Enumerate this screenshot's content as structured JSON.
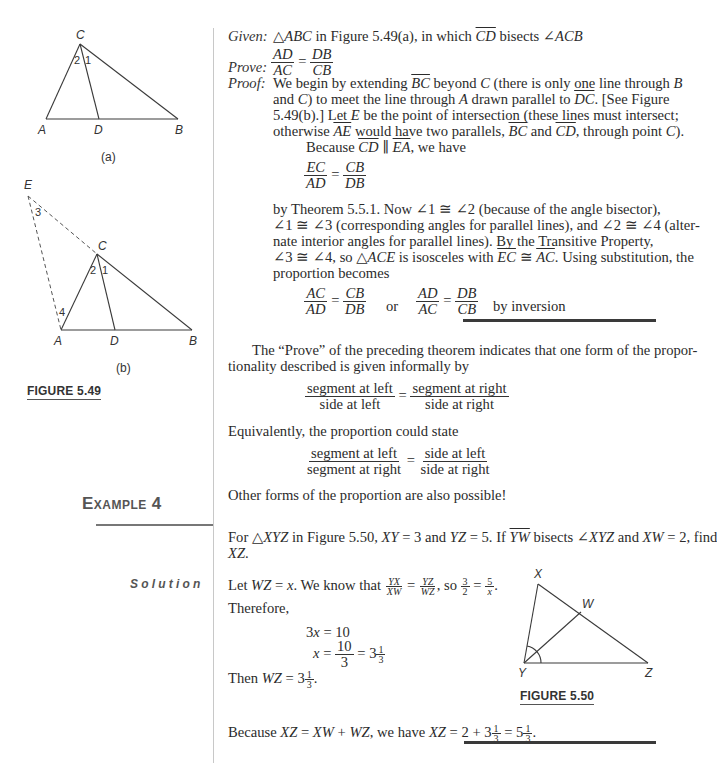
{
  "figure_5_49": {
    "caption": "FIGURE 5.49",
    "sub_a": {
      "label": "(a)",
      "points": {
        "A": "A",
        "B": "B",
        "C": "C",
        "D": "D"
      },
      "angles": {
        "one": "1",
        "two": "2"
      }
    },
    "sub_b": {
      "label": "(b)",
      "points": {
        "A": "A",
        "B": "B",
        "C": "C",
        "D": "D",
        "E": "E"
      },
      "angles": {
        "one": "1",
        "two": "2",
        "three": "3",
        "four": "4"
      }
    }
  },
  "proof": {
    "given_label": "Given:",
    "given_pre": "△",
    "given_tri": "ABC",
    "given_mid": " in Figure 5.49(a), in which ",
    "given_ray": "CD",
    "given_post": " bisects ∠",
    "given_angle": "ACB",
    "prove_label": "Prove:",
    "prove_frac": {
      "n1": "AD",
      "d1": "AC",
      "eq": "=",
      "n2": "DB",
      "d2": "CB"
    },
    "proof_label": "Proof:",
    "lines": {
      "l1_a": "We begin by extending ",
      "l1_seg": "BC",
      "l1_b": " beyond ",
      "l1_c": "C",
      "l1_d": " (there is only one line through ",
      "l1_e": "B",
      "l2_a": "and ",
      "l2_b": "C",
      "l2_c": ") to meet the line through ",
      "l2_d": "A",
      "l2_e": " drawn parallel to ",
      "l2_seg": "DC",
      "l2_f": ". [See Figure",
      "l3_a": "5.49(b).] Let ",
      "l3_b": "E",
      "l3_c": " be the point of intersection (these lines must intersect;",
      "l4_a": "otherwise ",
      "l4_seg1": "AE",
      "l4_b": " would have two parallels, ",
      "l4_seg2": "BC",
      "l4_c": " and ",
      "l4_seg3": "CD",
      "l4_d": ", through point ",
      "l4_e": "C",
      "l4_f": ").",
      "l5_a": "Because ",
      "l5_seg1": "CD",
      "l5_par": " ∥ ",
      "l5_seg2": "EA",
      "l5_b": ", we have"
    },
    "frac1": {
      "n1": "EC",
      "d1": "AD",
      "eq": "=",
      "n2": "CB",
      "d2": "DB"
    },
    "lines2": {
      "l6": "by Theorem 5.5.1. Now ∠1 ≅ ∠2 (because of the angle bisector),",
      "l7": "∠1 ≅ ∠3 (corresponding angles for parallel lines), and ∠2 ≅ ∠4 (alter-",
      "l8": "nate interior angles for parallel lines). By the Transitive Property,",
      "l9_a": "∠3 ≅ ∠4, so △",
      "l9_b": "ACE",
      "l9_c": " is isosceles with ",
      "l9_seg1": "EC",
      "l9_d": " ≅ ",
      "l9_seg2": "AC",
      "l9_e": ". Using substitution, the",
      "l10": "proportion becomes"
    },
    "frac2": {
      "n1": "AC",
      "d1": "AD",
      "eq": "=",
      "n2": "CB",
      "d2": "DB"
    },
    "or": "or",
    "frac3": {
      "n1": "AD",
      "d1": "AC",
      "eq": "=",
      "n2": "DB",
      "d2": "CB"
    },
    "by_inversion": "by inversion"
  },
  "discussion": {
    "p1_l1": "The “Prove” of the preceding theorem indicates that one form of the propor-",
    "p1_l2": "tionality described is given informally by",
    "frac_a": {
      "n1": "segment at left",
      "d1": "side at left",
      "eq": "=",
      "n2": "segment at right",
      "d2": "side at right"
    },
    "p2": "Equivalently, the proportion could state",
    "frac_b": {
      "n1": "segment at left",
      "d1": "segment at right",
      "eq": "=",
      "n2": "side at left",
      "d2": "side at right"
    },
    "p3": "Other forms of the proportion are also possible!"
  },
  "example": {
    "heading_first": "E",
    "heading_rest": "XAMPLE",
    "heading_num": "4",
    "prob_a": "For △",
    "prob_tri": "XYZ",
    "prob_b": " in Figure 5.50, ",
    "prob_c": "XY",
    "prob_d": " = 3 and ",
    "prob_e": "YZ",
    "prob_f": " = 5. If ",
    "prob_ray": "YW",
    "prob_g": " bisects ∠",
    "prob_h": "XYZ",
    "prob_i": " and ",
    "prob_j": "XW",
    "prob_k": " = 2, find",
    "prob_l2": "XZ",
    "prob_l2b": ".",
    "solution_label": "Solution",
    "sol": {
      "s1_a": "Let ",
      "s1_b": "WZ",
      "s1_c": " = ",
      "s1_d": "x",
      "s1_e": ". We know that ",
      "f1": {
        "n1": "YX",
        "d1": "XW",
        "n2": "YZ",
        "d2": "WZ"
      },
      "s1_f": ", so ",
      "f2": {
        "n1": "3",
        "d1": "2",
        "n2": "5",
        "d2": "x"
      },
      "s1_g": ".",
      "s2": "Therefore,",
      "eq1_a": "3",
      "eq1_b": "x",
      "eq1_c": " = 10",
      "eq2_a": "x",
      "eq2_b": " = ",
      "eq2_frac": {
        "n": "10",
        "d": "3"
      },
      "eq2_c": " = 3",
      "eq2_mixed": {
        "n": "1",
        "d": "3"
      },
      "s3_a": "Then ",
      "s3_b": "WZ",
      "s3_c": " = 3",
      "s3_mixed": {
        "n": "1",
        "d": "3"
      },
      "s3_d": ".",
      "s4_a": "Because ",
      "s4_b": "XZ",
      "s4_c": " = ",
      "s4_d": "XW",
      "s4_e": " + ",
      "s4_f": "WZ",
      "s4_g": ", we have ",
      "s4_h": "XZ",
      "s4_i": " = 2 + 3",
      "s4_m1": {
        "n": "1",
        "d": "3"
      },
      "s4_j": " = 5",
      "s4_m2": {
        "n": "1",
        "d": "3"
      },
      "s4_k": "."
    }
  },
  "figure_5_50": {
    "caption": "FIGURE 5.50",
    "points": {
      "X": "X",
      "W": "W",
      "Y": "Y",
      "Z": "Z"
    }
  }
}
